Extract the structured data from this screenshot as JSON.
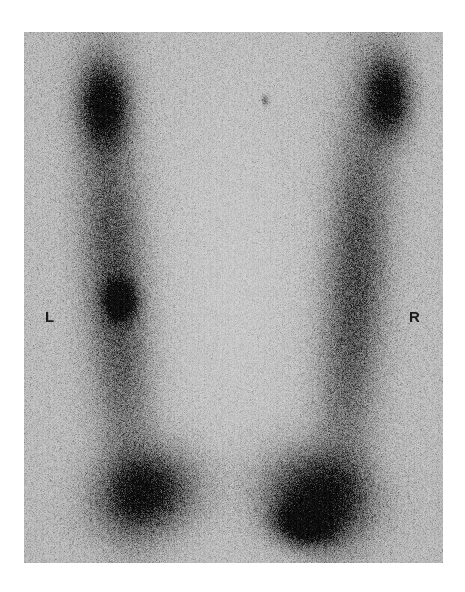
{
  "figure": {
    "modality": "bone-scintigraphy",
    "view": "anterior-lower-extremities",
    "plate_background_color": "#cfd0cf",
    "page_background_color": "#ffffff",
    "marker_color": "#1c1c1c",
    "plate": {
      "x": 24,
      "y": 32,
      "width": 419,
      "height": 531
    }
  },
  "markers": {
    "left": {
      "label": "L",
      "x": 45,
      "y": 309
    },
    "right": {
      "label": "R",
      "x": 409,
      "y": 309
    }
  },
  "chart_data": {
    "type": "heatmap",
    "title": "",
    "xlabel": "",
    "ylabel": "",
    "grid": false,
    "legend_position": "none",
    "colormap": "grayscale-inverted",
    "value_meaning": "radiotracer uptake (darker = higher counts)",
    "xlim": [
      0,
      419
    ],
    "ylim": [
      0,
      531
    ],
    "background_value": 0.06,
    "annotations": [
      {
        "text": "L",
        "x": 21,
        "y": 285
      },
      {
        "text": "R",
        "x": 385,
        "y": 285
      }
    ],
    "uptake_regions": [
      {
        "name": "left-femoral-shaft-band",
        "cx": 92,
        "cy": 250,
        "rx": 34,
        "ry": 215,
        "rotation": -4,
        "intensity": 0.58
      },
      {
        "name": "right-femoral-shaft-band",
        "cx": 330,
        "cy": 250,
        "rx": 34,
        "ry": 215,
        "rotation": 4,
        "intensity": 0.58
      },
      {
        "name": "left-proximal-hot-spot",
        "cx": 80,
        "cy": 72,
        "rx": 26,
        "ry": 44,
        "rotation": 0,
        "intensity": 0.88
      },
      {
        "name": "right-proximal-hot-spot",
        "cx": 364,
        "cy": 64,
        "rx": 24,
        "ry": 42,
        "rotation": 0,
        "intensity": 0.92
      },
      {
        "name": "left-focal-lesion",
        "cx": 96,
        "cy": 268,
        "rx": 17,
        "ry": 21,
        "rotation": 0,
        "intensity": 0.95
      },
      {
        "name": "left-distal-knee-uptake",
        "cx": 125,
        "cy": 460,
        "rx": 55,
        "ry": 42,
        "rotation": -18,
        "intensity": 0.9
      },
      {
        "name": "right-distal-knee-uptake",
        "cx": 290,
        "cy": 462,
        "rx": 58,
        "ry": 45,
        "rotation": 16,
        "intensity": 0.93
      },
      {
        "name": "right-distal-focal-hot",
        "cx": 278,
        "cy": 492,
        "rx": 32,
        "ry": 22,
        "rotation": 12,
        "intensity": 1.0
      },
      {
        "name": "midline-cold-channel",
        "cx": 210,
        "cy": 250,
        "rx": 78,
        "ry": 230,
        "rotation": 0,
        "intensity": 0.0
      },
      {
        "name": "incidental-speck",
        "cx": 241,
        "cy": 68,
        "rx": 3,
        "ry": 5,
        "rotation": 0,
        "intensity": 0.7
      }
    ]
  }
}
